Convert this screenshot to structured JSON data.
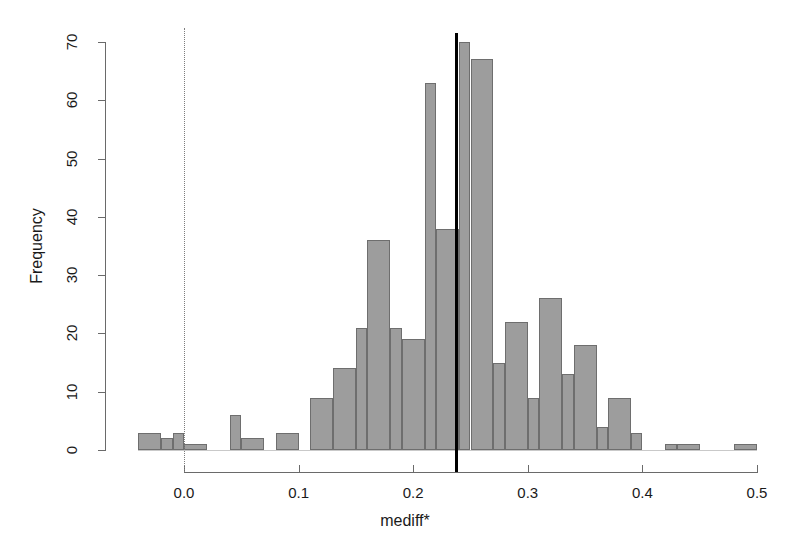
{
  "chart_data": {
    "type": "bar",
    "subtype": "histogram",
    "title": "",
    "xlabel": "mediff*",
    "ylabel": "Frequency",
    "xlim": [
      -0.05,
      0.51
    ],
    "ylim": [
      0,
      72
    ],
    "grid": false,
    "legend": null,
    "bin_width": 0.02,
    "bar_color": "#9d9d9d",
    "bar_border_color": "#6e6e6e",
    "xticks": [
      "0.0",
      "0.1",
      "0.2",
      "0.3",
      "0.4",
      "0.5"
    ],
    "xtick_values": [
      0.0,
      0.1,
      0.2,
      0.3,
      0.4,
      0.5
    ],
    "yticks": [
      "0",
      "10",
      "20",
      "30",
      "40",
      "50",
      "60",
      "70"
    ],
    "ytick_values": [
      0,
      10,
      20,
      30,
      40,
      50,
      60,
      70
    ],
    "bins": [
      {
        "left": -0.04,
        "right": -0.02,
        "value": 3
      },
      {
        "left": -0.02,
        "right": -0.01,
        "value": 2
      },
      {
        "left": -0.01,
        "right": 0.0,
        "value": 3
      },
      {
        "left": 0.0,
        "right": 0.02,
        "value": 1
      },
      {
        "left": 0.02,
        "right": 0.04,
        "value": 0
      },
      {
        "left": 0.04,
        "right": 0.05,
        "value": 6
      },
      {
        "left": 0.05,
        "right": 0.07,
        "value": 2
      },
      {
        "left": 0.07,
        "right": 0.08,
        "value": 0
      },
      {
        "left": 0.08,
        "right": 0.1,
        "value": 3
      },
      {
        "left": 0.1,
        "right": 0.11,
        "value": 0
      },
      {
        "left": 0.11,
        "right": 0.13,
        "value": 9
      },
      {
        "left": 0.13,
        "right": 0.15,
        "value": 14
      },
      {
        "left": 0.15,
        "right": 0.16,
        "value": 21
      },
      {
        "left": 0.16,
        "right": 0.18,
        "value": 36
      },
      {
        "left": 0.18,
        "right": 0.19,
        "value": 21
      },
      {
        "left": 0.19,
        "right": 0.21,
        "value": 19
      },
      {
        "left": 0.21,
        "right": 0.22,
        "value": 63
      },
      {
        "left": 0.22,
        "right": 0.24,
        "value": 38
      },
      {
        "left": 0.24,
        "right": 0.25,
        "value": 70
      },
      {
        "left": 0.25,
        "right": 0.27,
        "value": 67
      },
      {
        "left": 0.27,
        "right": 0.28,
        "value": 15
      },
      {
        "left": 0.28,
        "right": 0.3,
        "value": 22
      },
      {
        "left": 0.3,
        "right": 0.31,
        "value": 9
      },
      {
        "left": 0.31,
        "right": 0.33,
        "value": 26
      },
      {
        "left": 0.33,
        "right": 0.34,
        "value": 13
      },
      {
        "left": 0.34,
        "right": 0.36,
        "value": 18
      },
      {
        "left": 0.36,
        "right": 0.37,
        "value": 4
      },
      {
        "left": 0.37,
        "right": 0.39,
        "value": 9
      },
      {
        "left": 0.39,
        "right": 0.4,
        "value": 3
      },
      {
        "left": 0.4,
        "right": 0.42,
        "value": 0
      },
      {
        "left": 0.42,
        "right": 0.43,
        "value": 1
      },
      {
        "left": 0.43,
        "right": 0.45,
        "value": 1
      },
      {
        "left": 0.45,
        "right": 0.48,
        "value": 0
      },
      {
        "left": 0.48,
        "right": 0.5,
        "value": 1
      }
    ],
    "reference_lines": [
      {
        "name": "zero-reference",
        "x": 0.0,
        "style": "dotted",
        "color": "#7d7d7d"
      },
      {
        "name": "observed-statistic",
        "x": 0.237,
        "style": "solid",
        "color": "#000000"
      }
    ]
  }
}
